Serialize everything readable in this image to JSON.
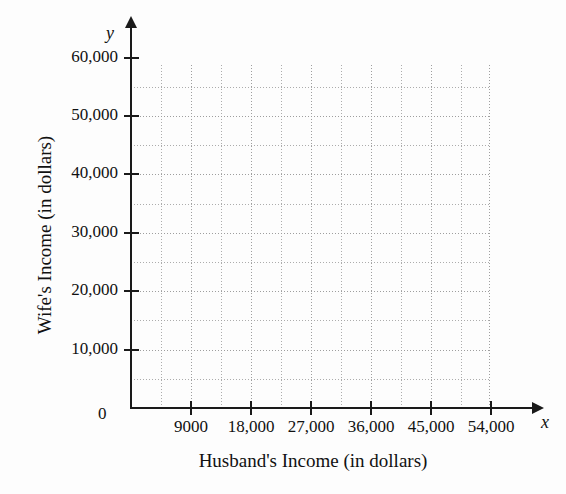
{
  "chart_data": {
    "type": "scatter",
    "title": "",
    "xlabel": "Husband's Income (in dollars)",
    "ylabel": "Wife's Income (in dollars)",
    "x_var": "x",
    "y_var": "y",
    "origin_label": "0",
    "xlim": [
      0,
      58500
    ],
    "ylim": [
      0,
      63000
    ],
    "x_major_ticks": [
      9000,
      18000,
      27000,
      36000,
      45000,
      54000
    ],
    "x_tick_labels": [
      "9000",
      "18,000",
      "27,000",
      "36,000",
      "45,000",
      "54,000"
    ],
    "y_major_ticks": [
      10000,
      20000,
      30000,
      40000,
      50000,
      60000
    ],
    "y_tick_labels": [
      "10,000",
      "20,000",
      "30,000",
      "40,000",
      "50,000",
      "60,000"
    ],
    "x_minor_step": 4500,
    "y_minor_step": 5000,
    "grid": true,
    "grid_style": "dotted",
    "grid_color": "#9e9e9e",
    "axis_color": "#1a1a1a",
    "background": "#fdfdfd",
    "legend": null,
    "series": [
      {
        "name": "Income pairs",
        "points": []
      }
    ],
    "note": "Empty grid: blank scatter-plot template with no plotted data points."
  },
  "axis": {
    "x_labels": [
      {
        "value": 9000,
        "text": "9000"
      },
      {
        "value": 18000,
        "text": "18,000"
      },
      {
        "value": 27000,
        "text": "27,000"
      },
      {
        "value": 36000,
        "text": "36,000"
      },
      {
        "value": 45000,
        "text": "45,000"
      },
      {
        "value": 54000,
        "text": "54,000"
      }
    ],
    "y_labels": [
      {
        "value": 60000,
        "text": "60,000"
      },
      {
        "value": 50000,
        "text": "50,000"
      },
      {
        "value": 40000,
        "text": "40,000"
      },
      {
        "value": 30000,
        "text": "30,000"
      },
      {
        "value": 20000,
        "text": "20,000"
      },
      {
        "value": 10000,
        "text": "10,000"
      }
    ],
    "origin": "0",
    "x_var": "x",
    "y_var": "y",
    "x_title": "Husband's Income (in dollars)",
    "y_title": "Wife's Income (in dollars)"
  }
}
